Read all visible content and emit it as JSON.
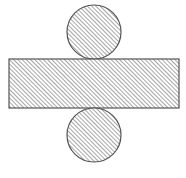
{
  "diagram": {
    "colors": {
      "background": "#ffffff",
      "stroke": "#555555",
      "hatch": "#6a6a6a"
    },
    "hatch": {
      "direction": "diagonal-forward-slash",
      "spacing": 3
    },
    "shapes": {
      "top_circle": {
        "cx": 94,
        "cy": 32,
        "r": 27
      },
      "rectangle": {
        "x": 9,
        "y": 59,
        "width": 170,
        "height": 49
      },
      "bottom_circle": {
        "cx": 94,
        "cy": 135,
        "r": 27
      }
    }
  }
}
